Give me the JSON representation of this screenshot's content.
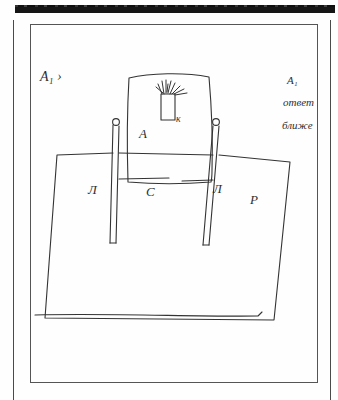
{
  "page": {
    "kind": "scanned-handwritten-sketch",
    "background_color": "#fefefe",
    "ink_color": "#303030",
    "scan_artifact_color": "#151515"
  },
  "annotations": {
    "top_left": {
      "text": "А₁ ›",
      "letter": "А",
      "subscript": "1",
      "mark": "›"
    },
    "top_right_line1": "А₁",
    "top_right_line2": "ответ",
    "top_right_line3": "ближе"
  },
  "labels": {
    "chair_back": "А",
    "slot": "к",
    "left_leg_region": "Л",
    "seat_center": "С",
    "right_leg_region": "Л",
    "right_surface": "Р"
  },
  "figure": {
    "parts": [
      "chair-back-panel",
      "brush-slot",
      "left-post",
      "right-post",
      "left-joint",
      "right-joint",
      "seat-surface",
      "floor-line"
    ]
  }
}
